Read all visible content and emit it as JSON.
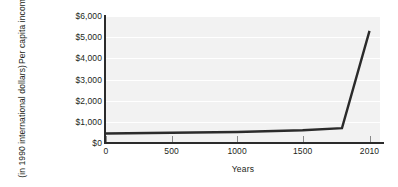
{
  "chart_data": {
    "type": "line",
    "title": "",
    "xlabel": "Years",
    "ylabel_line1": "Per capita income",
    "ylabel_line2": "(in 1990 international dollars)",
    "ylabel": "Per capita income (in 1990 international dollars)",
    "x": [
      0,
      1000,
      1500,
      1800,
      2010
    ],
    "values": [
      450,
      520,
      600,
      700,
      5300
    ],
    "series": [
      {
        "name": "Per capita income",
        "values": [
          450,
          520,
          600,
          700,
          5300
        ]
      }
    ],
    "xticks": [
      0,
      500,
      1000,
      1500,
      2010
    ],
    "xtick_labels": [
      "0",
      "500",
      "1000",
      "1500",
      "2010"
    ],
    "yticks": [
      0,
      1000,
      2000,
      3000,
      4000,
      5000,
      6000
    ],
    "ytick_labels": [
      "$0",
      "$1,000",
      "$2,000",
      "$3,000",
      "$4,000",
      "$5,000",
      "$6,000"
    ],
    "xlim": [
      0,
      2090
    ],
    "ylim": [
      0,
      6000
    ],
    "grid": true,
    "grid_axis": "y",
    "legend": false,
    "legend_position": "none",
    "line_color": "#2b2b2b",
    "plot_background": "#f2f2f2",
    "gridline_color": "#ffffff",
    "axis_color": "#2b2b2b",
    "text_color": "#231f20"
  }
}
